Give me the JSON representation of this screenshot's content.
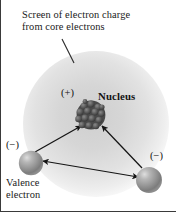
{
  "figure": {
    "background_color": "#ffffff",
    "width": 176,
    "height": 212
  },
  "captions": {
    "screen_line1": "Screen of electron charge",
    "screen_line2": "from core electrons",
    "valence_line1": "Valence",
    "valence_line2": "electron"
  },
  "labels": {
    "nucleus_charge": "(+)",
    "nucleus_name": "Nucleus",
    "electron_charge_left": "(−)",
    "electron_charge_right": "(−)"
  },
  "colors": {
    "screen_core": "#d4d4d4",
    "screen_edge": "#f2f2f2",
    "nucleus_dark": "#3d3d3d",
    "nucleus_light": "#6e6e6e",
    "electron_sphere": "#9a9a9a",
    "electron_highlight": "#d8d8d8",
    "arrow": "#1a1a1a",
    "text": "#111111",
    "border": "#3a3a3a"
  },
  "shapes": {
    "screen_circle": {
      "cx": 95,
      "cy": 124,
      "r": 73
    },
    "nucleus": {
      "cx": 90,
      "cy": 115,
      "r": 15
    },
    "electron_left": {
      "cx": 30,
      "cy": 163,
      "r": 12
    },
    "electron_right": {
      "cx": 148,
      "cy": 180,
      "r": 13
    },
    "leader_line": {
      "x1": 61,
      "y1": 39,
      "x2": 73,
      "y2": 63
    }
  },
  "arrows": {
    "left_to_nucleus": {
      "from_x": 33,
      "from_y": 152,
      "to_x": 79,
      "to_y": 125
    },
    "right_to_nucleus": {
      "from_x": 142,
      "from_y": 168,
      "to_x": 101,
      "to_y": 125
    },
    "between_electrons": {
      "x1": 41,
      "y1": 161,
      "x2": 138,
      "y2": 177,
      "double_headed": true
    }
  }
}
